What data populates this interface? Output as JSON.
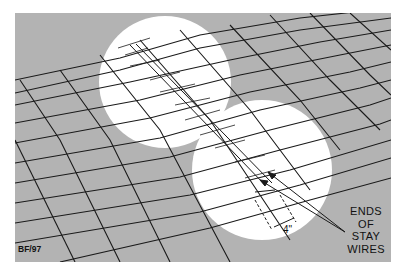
{
  "figure": {
    "code": "BF/97",
    "dimension_label": "4\"",
    "callout_lines": [
      "ENDS",
      "OF",
      "STAY",
      "WIRES"
    ],
    "colors": {
      "panel": "#b3b3b3",
      "highlight": "#ffffff",
      "wire": "#1a1a1a",
      "background": "#ffffff"
    }
  }
}
